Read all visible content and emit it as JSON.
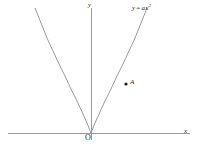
{
  "figure": {
    "background_color": "#ffffff",
    "width": 198,
    "height": 148,
    "axis_color": "#9a9a9a",
    "curve_color": "#9a9a9a",
    "point_color": "#1a1a1a",
    "text_color": "#2a2a2a"
  },
  "labels": {
    "y_axis": "y",
    "x_axis": "x",
    "origin": "O",
    "point_a": "A",
    "equation_lhs": "y",
    "equation_operator": "=",
    "equation_coefficient": "a",
    "equation_variable": "x",
    "equation_exponent": "2",
    "equation_full": "y = ax²"
  },
  "chart_data": {
    "type": "line",
    "title": "",
    "subtitle": "",
    "xlabel": "x",
    "ylabel": "y",
    "grid": false,
    "legend": null,
    "annotations": [
      {
        "name": "curve-label",
        "text": "y = ax²",
        "x_px": 133,
        "y_px": 7
      },
      {
        "name": "origin-label",
        "text": "O",
        "x_px": 87,
        "y_px": 139
      },
      {
        "name": "point-label",
        "text": "A",
        "x_px": 131,
        "y_px": 83
      }
    ],
    "axes_px": {
      "x_axis_y": 133,
      "x_axis_from_x": 8,
      "x_axis_to_x": 190,
      "y_axis_x": 91,
      "y_axis_from_y": 8,
      "y_axis_to_y": 140
    },
    "series": [
      {
        "name": "y = ax²",
        "equation": "y = a*x^2",
        "vertex_px": [
          91,
          133
        ],
        "coefficient_px": 0.04,
        "path_points_px": [
          [
            35,
            8
          ],
          [
            41,
            23
          ],
          [
            47,
            38
          ],
          [
            53,
            51
          ],
          [
            59,
            64
          ],
          [
            65,
            76
          ],
          [
            71,
            89
          ],
          [
            77,
            101
          ],
          [
            83,
            114
          ],
          [
            87,
            123
          ],
          [
            91,
            133
          ],
          [
            95,
            123
          ],
          [
            99,
            114
          ],
          [
            105,
            101
          ],
          [
            111,
            89
          ],
          [
            117,
            76
          ],
          [
            123,
            64
          ],
          [
            129,
            51
          ],
          [
            135,
            38
          ],
          [
            141,
            23
          ],
          [
            147,
            8
          ]
        ]
      }
    ],
    "points": [
      {
        "label": "A",
        "x_px": 126,
        "y_px": 84,
        "radius_px": 1.6,
        "on_curve": true
      }
    ]
  }
}
